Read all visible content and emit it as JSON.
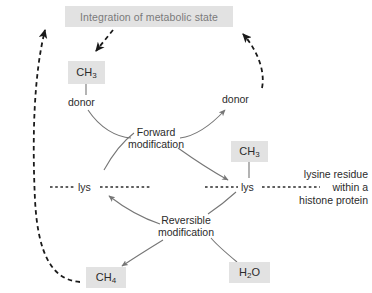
{
  "diagram": {
    "title_box": {
      "label": "Integration of metabolic state"
    },
    "nodes": {
      "methyl_donor_source": "CH3",
      "methyl_on_lysine": "CH3",
      "methane_product": "CH4",
      "water_substrate": "H2O"
    },
    "labels": {
      "donor_left": "donor",
      "donor_right": "donor",
      "forward_line1": "Forward",
      "forward_line2": "modification",
      "reversible_line1": "Reversible",
      "reversible_line2": "modification",
      "lys_left": "lys",
      "lys_right": "lys",
      "annotation_line1": "lysine residue",
      "annotation_line2": "within a",
      "annotation_line3": "histone protein"
    },
    "colors": {
      "box_fill": "#e2e2e2",
      "title_text": "#7a7a7a",
      "body_text": "#2b2b2b",
      "arrow_solid": "#767676",
      "arrow_dashed": "#1a1a1a",
      "background": "#ffffff"
    }
  }
}
